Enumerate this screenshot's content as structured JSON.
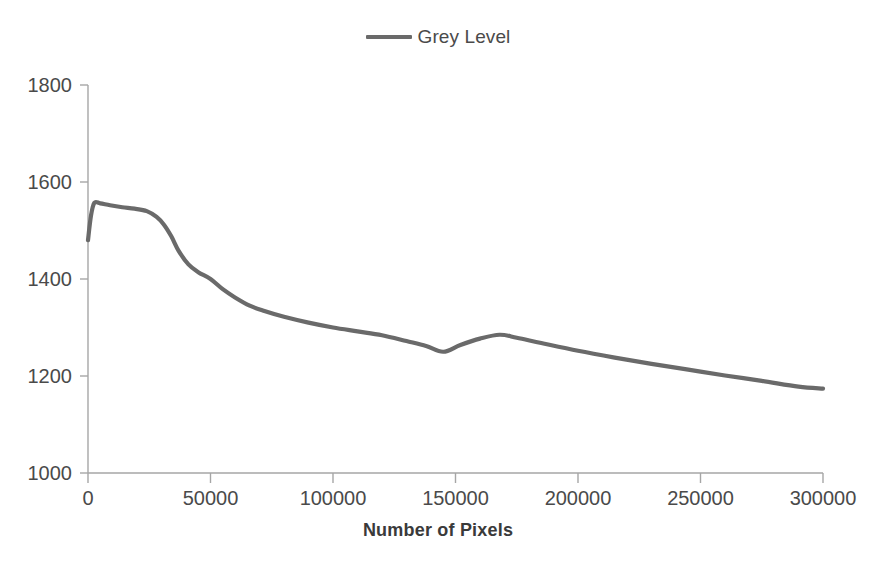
{
  "legend": {
    "position": "top-center",
    "entries": [
      {
        "label": "Grey Level",
        "color": "#6a6a6a",
        "marker": "line-swatch"
      }
    ]
  },
  "axes": {
    "x_title": "Number of Pixels",
    "y_title": "",
    "x_ticks": [
      "0",
      "50000",
      "100000",
      "150000",
      "200000",
      "250000",
      "300000"
    ],
    "y_ticks": [
      "1000",
      "1200",
      "1400",
      "1600",
      "1800"
    ]
  },
  "chart_data": {
    "type": "line",
    "title": "",
    "subtitle": "",
    "xlabel": "Number of Pixels",
    "ylabel": "",
    "xlim": [
      0,
      300000
    ],
    "ylim": [
      1000,
      1800
    ],
    "xtick_values": [
      0,
      50000,
      100000,
      150000,
      200000,
      250000,
      300000
    ],
    "ytick_values": [
      1000,
      1200,
      1400,
      1600,
      1800
    ],
    "grid": false,
    "legend_position": "top-center",
    "series": [
      {
        "name": "Grey Level",
        "color": "#6a6a6a",
        "line_width": 4.2,
        "x": [
          0,
          1200,
          2600,
          5000,
          9000,
          14000,
          19000,
          24000,
          28000,
          31000,
          34000,
          37000,
          41000,
          45000,
          50000,
          55000,
          60000,
          66000,
          72000,
          80000,
          90000,
          100000,
          110000,
          120000,
          130000,
          138000,
          145000,
          152000,
          160000,
          168000,
          175000,
          185000,
          200000,
          215000,
          230000,
          245000,
          260000,
          275000,
          290000,
          300000
        ],
        "y": [
          1480,
          1530,
          1557,
          1556,
          1552,
          1548,
          1545,
          1540,
          1528,
          1512,
          1488,
          1458,
          1430,
          1414,
          1400,
          1379,
          1362,
          1345,
          1334,
          1322,
          1310,
          1300,
          1292,
          1284,
          1272,
          1262,
          1250,
          1264,
          1277,
          1285,
          1279,
          1268,
          1252,
          1238,
          1225,
          1213,
          1201,
          1190,
          1178,
          1174
        ]
      }
    ],
    "annotations": [
      {
        "text": "initial rise to peak",
        "x": 2600,
        "y": 1557
      },
      {
        "text": "local minimum",
        "x": 145000,
        "y": 1250
      },
      {
        "text": "secondary bump",
        "x": 168000,
        "y": 1285
      }
    ]
  }
}
